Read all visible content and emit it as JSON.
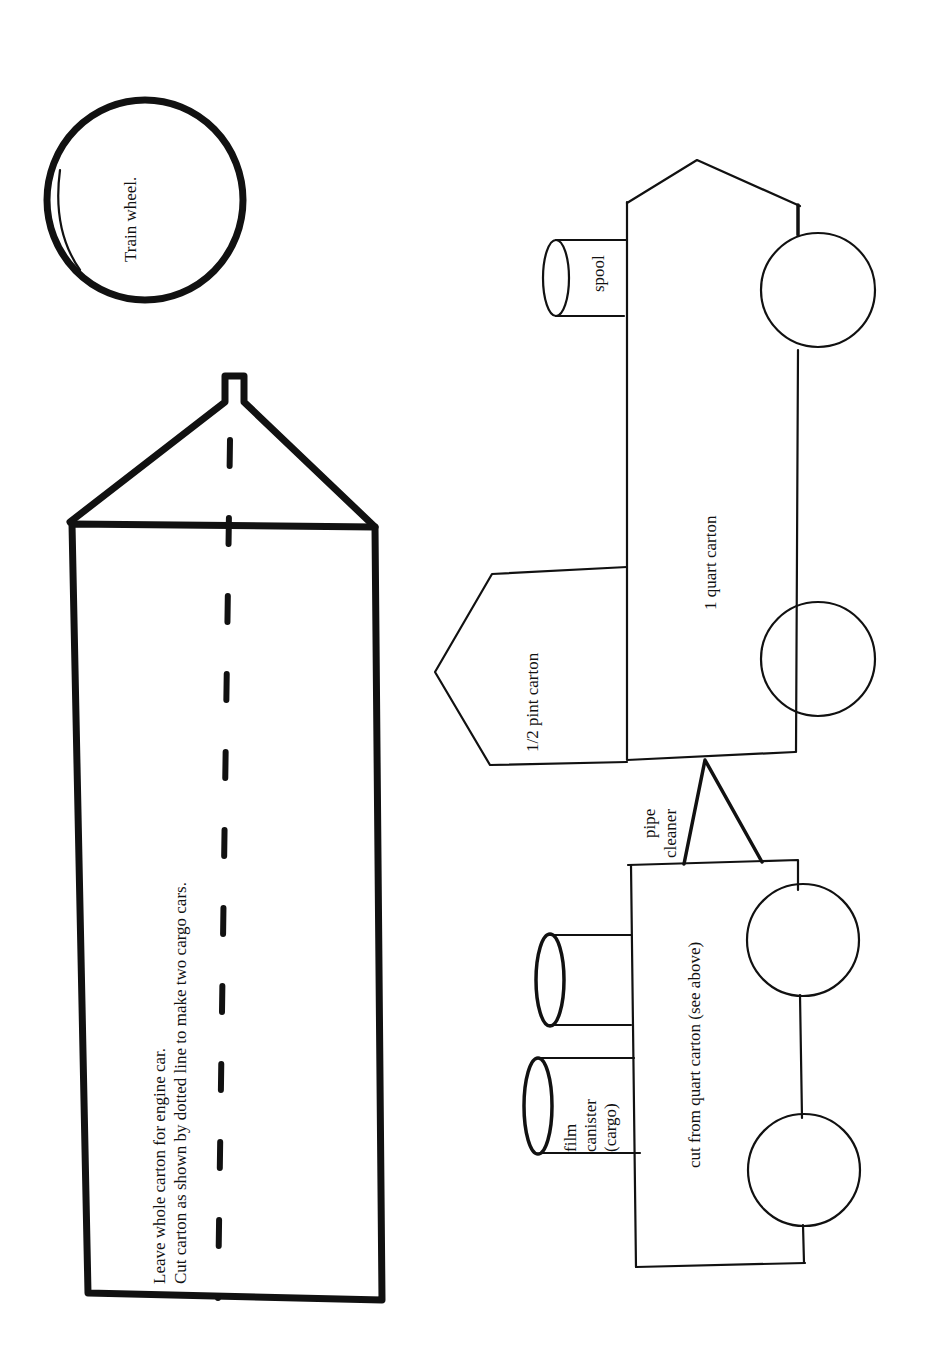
{
  "diagram": {
    "orientation": "rotated 90° counter-clockwise",
    "colors": {
      "ink": "#111111",
      "paper": "#ffffff"
    },
    "wheel_template": {
      "label": "Train wheel."
    },
    "carton_template": {
      "instruction_line1": "Leave whole carton for engine car.",
      "instruction_line2": "Cut carton as shown by  dotted line to make two cargo cars."
    },
    "engine": {
      "body_label": "1 quart carton",
      "cab_label": "1/2 pint carton",
      "smokestack_label": "spool"
    },
    "coupler": {
      "label_line1": "pipe",
      "label_line2": "cleaner"
    },
    "cargo_car": {
      "body_label": "cut from quart carton (see above)",
      "cargo_label_line1": "film",
      "cargo_label_line2": "canister",
      "cargo_label_line3": "(cargo)"
    }
  }
}
